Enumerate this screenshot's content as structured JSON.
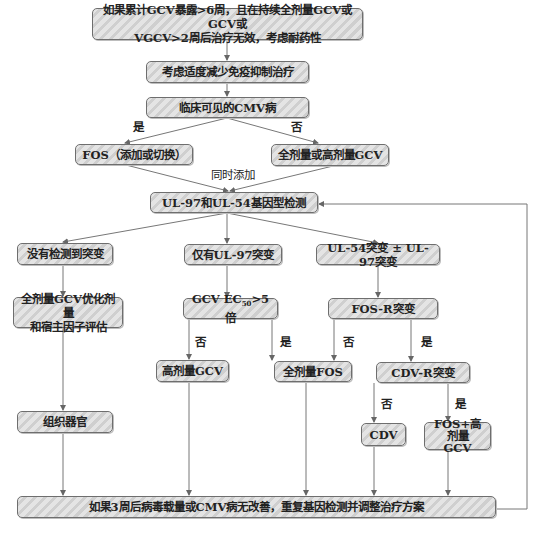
{
  "nodes": {
    "start": {
      "line1": "如果累计GCV暴露>6周，且在持续全剂量GCV或GCV或",
      "line2": "VGCV>2周后治疗无效，考虑耐药性"
    },
    "reduce_immuno": {
      "label": "考虑适度减少免疫抑制治疗"
    },
    "clinical_cmv": {
      "label": "临床可见的CMV病"
    },
    "fos_add_switch": {
      "label": "FOS（添加或切换）"
    },
    "full_high_gcv": {
      "label": "全剂量或高剂量GCV"
    },
    "genotype_test": {
      "label": "UL-97和UL-54基因型检测"
    },
    "no_mutation": {
      "label": "没有检测到突变"
    },
    "ul97_only": {
      "label": "仅有UL-97突变"
    },
    "ul54_mutation": {
      "label": "UL-54突变 ± UL-97突变"
    },
    "optimize_gcv": {
      "line1": "全剂量GCV优化剂量",
      "line2": "和宿主因子评估"
    },
    "gcv_ec50": {
      "prefix": "GCV EC",
      "sub": "50",
      "suffix": ">5倍"
    },
    "fos_r": {
      "label": "FOS-R突变"
    },
    "high_gcv": {
      "label": "高剂量GCV"
    },
    "full_fos": {
      "label": "全剂量FOS"
    },
    "cdv_r": {
      "label": "CDV-R突变"
    },
    "tissue": {
      "label": "组织器官"
    },
    "cdv": {
      "label": "CDV"
    },
    "fos_high_gcv": {
      "line1": "FOS+高剂量",
      "line2": "GCV"
    },
    "final": {
      "label": "如果3周后病毒载量或CMV病无改善，重复基因检测并调整治疗方案"
    }
  },
  "edge_labels": {
    "yes_clinical": "是",
    "no_clinical": "否",
    "simultaneous": "同时添加",
    "ec50_no": "否",
    "ec50_yes": "是",
    "fosr_no": "否",
    "fosr_yes": "是",
    "cdvr_no": "否",
    "cdvr_yes": "是"
  },
  "colors": {
    "line": "#666666",
    "box_border": "#6e6e6e",
    "hatch_light": "#e4e4e4",
    "hatch_dark": "#cfcfcf"
  }
}
